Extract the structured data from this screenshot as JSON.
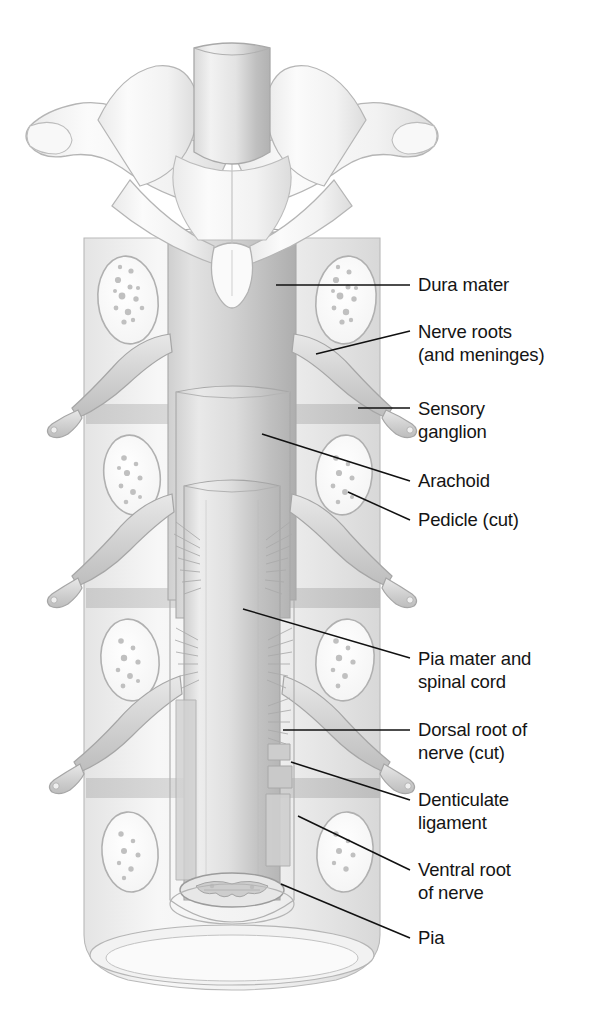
{
  "figure": {
    "background_color": "#ffffff",
    "ink_color": "#141414",
    "palette": {
      "bone_light": "#f4f4f4",
      "bone_mid": "#e6e6e6",
      "bone_shadow": "#cfcfcf",
      "dura_gray": "#c9c9c9",
      "dura_shadow": "#b0b0b0",
      "cord_gray": "#d6d6d6",
      "cord_shadow": "#bdbdbd",
      "outline": "#9a9a9a",
      "marrow_speck": "#b8b8b8",
      "leader_line": "#111111"
    }
  },
  "labels": [
    {
      "id": "dura-mater",
      "text": "Dura mater",
      "lines": [
        "Dura mater"
      ],
      "text_x": 418,
      "text_y": 291,
      "leader": {
        "x1": 276,
        "y1": 285,
        "x2": 410,
        "y2": 285
      }
    },
    {
      "id": "nerve-roots",
      "text": "Nerve roots (and meninges)",
      "lines": [
        "Nerve roots",
        "(and meninges)"
      ],
      "text_x": 418,
      "text_y": 338,
      "leader": {
        "x1": 316,
        "y1": 354,
        "x2": 410,
        "y2": 331
      }
    },
    {
      "id": "sensory-ganglion",
      "text": "Sensory ganglion",
      "lines": [
        "Sensory",
        "ganglion"
      ],
      "text_x": 418,
      "text_y": 415,
      "leader": {
        "x1": 358,
        "y1": 408,
        "x2": 410,
        "y2": 408
      }
    },
    {
      "id": "arachoid",
      "text": "Arachoid",
      "lines": [
        "Arachoid"
      ],
      "text_x": 418,
      "text_y": 487,
      "leader": {
        "x1": 262,
        "y1": 434,
        "x2": 410,
        "y2": 481
      }
    },
    {
      "id": "pedicle-cut",
      "text": "Pedicle (cut)",
      "lines": [
        "Pedicle (cut)"
      ],
      "text_x": 418,
      "text_y": 526,
      "leader": {
        "x1": 348,
        "y1": 492,
        "x2": 410,
        "y2": 520
      }
    },
    {
      "id": "pia-mater-and-spinal-cord",
      "text": "Pia mater and spinal cord",
      "lines": [
        "Pia mater and",
        "spinal cord"
      ],
      "text_x": 418,
      "text_y": 665,
      "leader": {
        "x1": 243,
        "y1": 609,
        "x2": 410,
        "y2": 658
      }
    },
    {
      "id": "dorsal-root-of-nerve-cut",
      "text": "Dorsal root of nerve (cut)",
      "lines": [
        "Dorsal root of",
        "nerve (cut)"
      ],
      "text_x": 418,
      "text_y": 736,
      "leader": {
        "x1": 283,
        "y1": 730,
        "x2": 410,
        "y2": 730
      }
    },
    {
      "id": "denticulate-ligament",
      "text": "Denticulate ligament",
      "lines": [
        "Denticulate",
        "ligament"
      ],
      "text_x": 418,
      "text_y": 806,
      "leader": {
        "x1": 291,
        "y1": 762,
        "x2": 410,
        "y2": 800
      }
    },
    {
      "id": "ventral-root-of-nerve",
      "text": "Ventral root of nerve",
      "lines": [
        "Ventral root",
        "of nerve"
      ],
      "text_x": 418,
      "text_y": 876,
      "leader": {
        "x1": 298,
        "y1": 816,
        "x2": 410,
        "y2": 870
      }
    },
    {
      "id": "pia",
      "text": "Pia",
      "lines": [
        "Pia"
      ],
      "text_x": 418,
      "text_y": 944,
      "leader": {
        "x1": 281,
        "y1": 884,
        "x2": 410,
        "y2": 938
      }
    }
  ],
  "structures": [
    {
      "id": "vertebra-top",
      "name": "top vertebra with transverse processes"
    },
    {
      "id": "spinal-cord-stump-top",
      "name": "cut upper end of spinal cord"
    },
    {
      "id": "dural-sac",
      "name": "dura mater sheath"
    },
    {
      "id": "arachnoid-sleeve",
      "name": "arachnoid layer"
    },
    {
      "id": "spinal-cord",
      "name": "spinal cord covered by pia mater"
    },
    {
      "id": "pedicle-cut-left",
      "name": "cut pedicle left with cancellous bone"
    },
    {
      "id": "pedicle-cut-right",
      "name": "cut pedicle right with cancellous bone"
    },
    {
      "id": "spinal-nerve-left",
      "name": "spinal nerve exiting left"
    },
    {
      "id": "spinal-nerve-right",
      "name": "spinal nerve exiting right"
    },
    {
      "id": "dorsal-rootlets",
      "name": "dorsal nerve rootlets"
    },
    {
      "id": "denticulate-ligament-band",
      "name": "denticulate ligament"
    },
    {
      "id": "cord-cross-section",
      "name": "cut face of cord showing gray matter"
    },
    {
      "id": "dural-sac-opening",
      "name": "open lower end of dural sac"
    }
  ]
}
